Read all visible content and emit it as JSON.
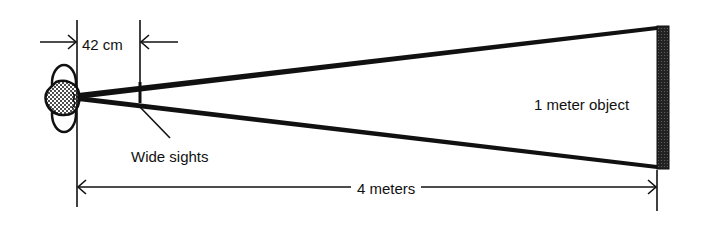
{
  "diagram": {
    "labels": {
      "sight_distance": "42 cm",
      "sights": "Wide sights",
      "object": "1 meter object",
      "object_distance": "4 meters"
    },
    "elements": [
      {
        "id": "observer-head",
        "type": "head-top-view",
        "note": "stippled head with ears, eye at apex"
      },
      {
        "id": "sight-lines",
        "type": "converging-lines",
        "from": "eye",
        "to": "object-edges"
      },
      {
        "id": "wide-sights",
        "type": "short vertical bar",
        "position": "42 cm from eye"
      },
      {
        "id": "object",
        "type": "stippled vertical bar",
        "position": "4 meters from eye",
        "size": "1 meter"
      }
    ],
    "colors": {
      "ink": "#111111",
      "background": "#ffffff"
    }
  }
}
